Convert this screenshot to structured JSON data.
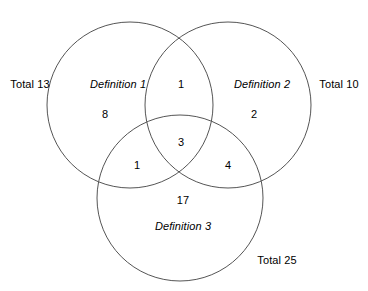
{
  "diagram": {
    "type": "venn-3-set",
    "stroke_color": "#555555",
    "text_color": "#000000",
    "background_color": "#ffffff",
    "sets": [
      {
        "id": "definition-1",
        "label": "Definition 1",
        "total_label": "Total 13",
        "total_value": 13,
        "label_x": 118,
        "label_y": 84,
        "total_x": 30,
        "total_y": 84,
        "cx": 130,
        "cy": 105,
        "r": 83
      },
      {
        "id": "definition-2",
        "label": "Definition 2",
        "total_label": "Total 10",
        "total_value": 10,
        "label_x": 262,
        "label_y": 84,
        "total_x": 339,
        "total_y": 84,
        "cx": 228,
        "cy": 105,
        "r": 83
      },
      {
        "id": "definition-3",
        "label": "Definition 3",
        "total_label": "Total 25",
        "total_value": 25,
        "label_x": 183,
        "label_y": 226,
        "total_x": 277,
        "total_y": 260,
        "cx": 180,
        "cy": 198,
        "r": 83
      }
    ],
    "regions": [
      {
        "id": "only-1",
        "value": "8",
        "x": 105,
        "y": 114
      },
      {
        "id": "one-and-two",
        "value": "1",
        "x": 181,
        "y": 84
      },
      {
        "id": "only-2",
        "value": "2",
        "x": 254,
        "y": 114
      },
      {
        "id": "all-three",
        "value": "3",
        "x": 181,
        "y": 142
      },
      {
        "id": "one-and-three",
        "value": "1",
        "x": 137,
        "y": 165
      },
      {
        "id": "two-and-three",
        "value": "4",
        "x": 228,
        "y": 165
      },
      {
        "id": "only-3",
        "value": "17",
        "x": 183,
        "y": 200
      }
    ]
  },
  "chart_data": {
    "type": "table",
    "title": "",
    "categories": [
      "Definition 1 only",
      "Definition 1 and Definition 2",
      "Definition 2 only",
      "Definition 1, 2 and 3",
      "Definition 1 and Definition 3",
      "Definition 2 and Definition 3",
      "Definition 3 only"
    ],
    "values": [
      8,
      1,
      2,
      3,
      1,
      4,
      17
    ],
    "set_totals": {
      "Definition 1": 13,
      "Definition 2": 10,
      "Definition 3": 25
    }
  }
}
